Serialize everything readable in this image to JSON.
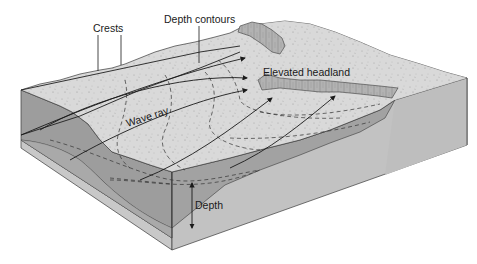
{
  "diagram": {
    "type": "block-diagram",
    "labels": {
      "crests": "Crests",
      "depth_contours": "Depth contours",
      "elevated_headland": "Elevated headland",
      "wave_ray": "Wave ray",
      "depth": "Depth"
    },
    "colors": {
      "background": "#ffffff",
      "top_surface": "#d9d9d9",
      "headland_cliff": "#a9a9a9",
      "water_side": "#9c9c9c",
      "sediment_side": "#c4c4c4",
      "right_face": "#bdbdbd",
      "line": "#2a2a2a"
    },
    "elements": [
      "wave crests (solid lines on surface)",
      "depth contours (dashed lines)",
      "wave rays (arrowed lines converging on headland)",
      "elevated headland (cliffed promontory)",
      "depth indicator (double-headed arrow on front face)"
    ]
  }
}
